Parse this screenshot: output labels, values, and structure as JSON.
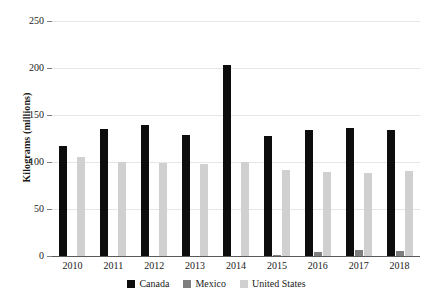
{
  "chart_data": {
    "type": "bar",
    "title": "",
    "xlabel": "",
    "ylabel": "Kilograms (millions)",
    "ylim": [
      0,
      250
    ],
    "yticks": [
      0,
      50,
      100,
      150,
      200,
      250
    ],
    "grid": true,
    "legend_position": "bottom",
    "categories": [
      "2010",
      "2011",
      "2012",
      "2013",
      "2014",
      "2015",
      "2016",
      "2017",
      "2018"
    ],
    "series": [
      {
        "name": "Canada",
        "color": "#0d0d0d",
        "values": [
          117,
          135,
          139,
          129,
          203,
          128,
          134,
          136,
          134
        ]
      },
      {
        "name": "Mexico",
        "color": "#7f7f7f",
        "values": [
          0,
          0,
          0,
          0,
          0,
          1,
          4,
          6,
          5
        ]
      },
      {
        "name": "United States",
        "color": "#d0d0d0",
        "values": [
          105,
          100,
          99,
          98,
          100,
          91,
          89,
          88,
          90
        ]
      }
    ]
  },
  "axis": {
    "y_title": "Kilograms (millions)",
    "y_tick_labels": [
      "250",
      "200",
      "150",
      "100",
      "50",
      "0"
    ]
  },
  "legend": {
    "items": [
      {
        "label": "Canada",
        "color": "#0d0d0d"
      },
      {
        "label": "Mexico",
        "color": "#7f7f7f"
      },
      {
        "label": "United States",
        "color": "#d0d0d0"
      }
    ]
  }
}
